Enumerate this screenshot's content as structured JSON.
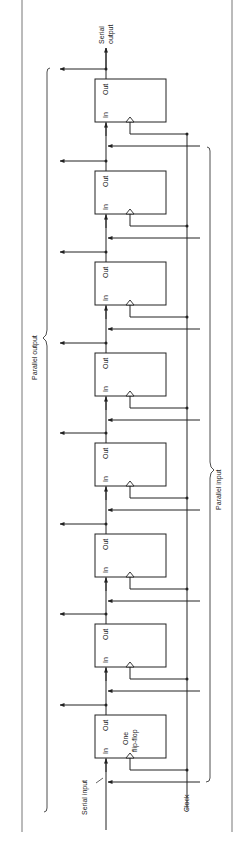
{
  "figure": {
    "labels": {
      "serial_output": [
        "Serial",
        "output"
      ],
      "serial_input": "Serial input",
      "clock": "Clock",
      "parallel_output": "Parallel output",
      "parallel_input": "Parallel input",
      "one_flip_flop": [
        "One",
        "flip-flop"
      ]
    },
    "flip_flop": {
      "in_label": "In",
      "out_label": "Out",
      "count": 8
    }
  },
  "colors": {
    "line": "#222222",
    "border": "#777777",
    "background": "#ffffff"
  }
}
